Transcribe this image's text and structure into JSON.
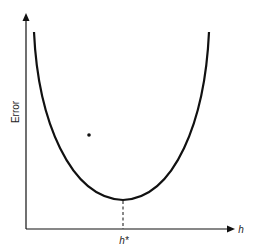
{
  "diagram": {
    "type": "error-vs-parameter curve",
    "y_axis_label": "Error",
    "x_axis_label": "h",
    "minimum_label": "h*",
    "curve": "U-shaped convex curve with minimum at h*",
    "colors": {
      "line": "#111111",
      "background": "#ffffff"
    }
  }
}
